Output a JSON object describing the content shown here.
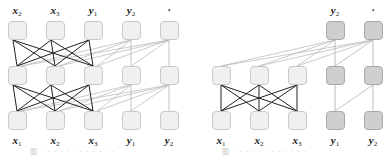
{
  "panels": [
    {
      "id": "left",
      "top_labels": [
        {
          "var": "x",
          "sub": "2"
        },
        {
          "var": "x",
          "sub": "3"
        },
        {
          "var": "y",
          "sub": "1"
        },
        {
          "var": "y",
          "sub": "2"
        },
        {
          "var": "·",
          "sub": ""
        }
      ],
      "bottom_labels": [
        {
          "var": "x",
          "sub": "1"
        },
        {
          "var": "x",
          "sub": "2"
        },
        {
          "var": "x",
          "sub": "3"
        },
        {
          "var": "y",
          "sub": "1"
        },
        {
          "var": "y",
          "sub": "2"
        }
      ],
      "caption": "图 ·  ·  ·  ·  ·  ·  ·  ·  ·  ·  ·  ·"
    },
    {
      "id": "right",
      "top_labels": [
        {
          "var": "y",
          "sub": "2"
        },
        {
          "var": "·",
          "sub": ""
        }
      ],
      "bottom_labels": [
        {
          "var": "x",
          "sub": "1"
        },
        {
          "var": "x",
          "sub": "2"
        },
        {
          "var": "x",
          "sub": "3"
        },
        {
          "var": "y",
          "sub": "1"
        },
        {
          "var": "y",
          "sub": "2"
        }
      ],
      "caption": "图 ·  ·  ·  ·  ·  ·  ·  ·  ·  ·  ·  ·"
    }
  ],
  "colors": {
    "node_light_fill": "#f0f0f0",
    "node_dark_fill": "#cfcfcf",
    "edge_dark": "#222222",
    "edge_light": "#b5b5b5"
  }
}
